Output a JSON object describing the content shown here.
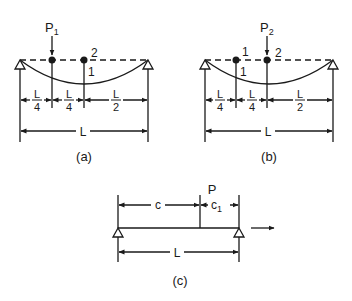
{
  "panels": {
    "a": {
      "caption": "(a)",
      "load_label": "P",
      "load_sub": "1",
      "point_1_label": "1",
      "point_2_label": "2",
      "dims": {
        "seg1_num": "L",
        "seg1_den": "4",
        "seg2_num": "L",
        "seg2_den": "4",
        "seg3_num": "L",
        "seg3_den": "2",
        "total": "L"
      }
    },
    "b": {
      "caption": "(b)",
      "load_label": "P",
      "load_sub": "2",
      "point_1_label": "1",
      "point_1_below": "1",
      "point_2_label": "2",
      "dims": {
        "seg1_num": "L",
        "seg1_den": "4",
        "seg2_num": "L",
        "seg2_den": "4",
        "seg3_num": "L",
        "seg3_den": "2",
        "total": "L"
      }
    },
    "c": {
      "caption": "(c)",
      "load_label": "P",
      "dim_c": "c",
      "dim_c1": "c",
      "dim_c1_sub": "1",
      "total": "L"
    }
  },
  "colors": {
    "ink": "#1a1a1a",
    "background": "#ffffff"
  }
}
